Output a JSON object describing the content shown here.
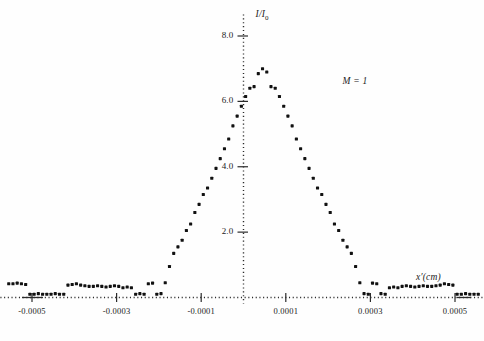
{
  "chart_data": {
    "type": "scatter",
    "title": "",
    "xlabel": "x'(cm)",
    "ylabel": "I/I_0",
    "ylabel_parts": {
      "numerator": "I",
      "denominator": "I",
      "subscript": "0"
    },
    "annotations": [
      {
        "text": "M = 1",
        "x": 0.00022,
        "y": 6.55
      }
    ],
    "xlim": [
      -0.00057,
      0.00057
    ],
    "ylim": [
      0,
      8.6
    ],
    "xticks": [
      -0.0005,
      -0.0003,
      -0.0001,
      0.0001,
      0.0003,
      0.0005
    ],
    "xtick_labels": [
      "-0.0005",
      "-0.0003",
      "-0.0001",
      "0.0001",
      "0.0003",
      "0.0005"
    ],
    "yticks": [
      2.0,
      4.0,
      6.0,
      8.0
    ],
    "ytick_labels": [
      "2.0",
      "4.0",
      "6.0",
      "8.0"
    ],
    "grid": false,
    "axis_style": "dotted",
    "marker": "square-dot",
    "marker_color": "#111111",
    "series": [
      {
        "name": "M = 1 intensity profile",
        "x": [
          -0.000555,
          -0.000545,
          -0.000535,
          -0.000525,
          -0.000515,
          -0.000505,
          -0.000495,
          -0.000485,
          -0.000475,
          -0.000465,
          -0.000455,
          -0.000445,
          -0.000435,
          -0.000425,
          -0.000415,
          -0.000405,
          -0.000395,
          -0.000385,
          -0.000375,
          -0.000365,
          -0.000355,
          -0.000345,
          -0.000335,
          -0.000325,
          -0.000315,
          -0.000305,
          -0.000295,
          -0.000285,
          -0.000275,
          -0.000265,
          -0.000255,
          -0.000245,
          -0.000235,
          -0.000225,
          -0.000215,
          -0.000205,
          -0.000195,
          -0.000185,
          -0.000175,
          -0.000165,
          -0.000155,
          -0.000145,
          -0.000135,
          -0.000125,
          -0.000115,
          -0.000105,
          -9.5e-05,
          -8.5e-05,
          -7.5e-05,
          -6.5e-05,
          -5.5e-05,
          -4.5e-05,
          -3.5e-05,
          -2.5e-05,
          -1.5e-05,
          -5e-06,
          5e-06,
          1.5e-05,
          2.5e-05,
          3.5e-05,
          4.5e-05,
          5.5e-05,
          6.5e-05,
          7.5e-05,
          8.5e-05,
          9.5e-05,
          0.000105,
          0.000115,
          0.000125,
          0.000135,
          0.000145,
          0.000155,
          0.000165,
          0.000175,
          0.000185,
          0.000195,
          0.000205,
          0.000215,
          0.000225,
          0.000235,
          0.000245,
          0.000255,
          0.000265,
          0.000275,
          0.000285,
          0.000295,
          0.000305,
          0.000315,
          0.000325,
          0.000335,
          0.000345,
          0.000355,
          0.000365,
          0.000375,
          0.000385,
          0.000395,
          0.000405,
          0.000415,
          0.000425,
          0.000435,
          0.000445,
          0.000455,
          0.000465,
          0.000475,
          0.000485,
          0.000495,
          0.000505,
          0.000515,
          0.000525,
          0.000535,
          0.000545,
          0.000555
        ],
        "y": [
          0.42,
          0.42,
          0.44,
          0.42,
          0.4,
          0.1,
          0.1,
          0.12,
          0.1,
          0.1,
          0.1,
          0.12,
          0.1,
          0.1,
          0.38,
          0.4,
          0.42,
          0.38,
          0.36,
          0.34,
          0.34,
          0.36,
          0.34,
          0.32,
          0.34,
          0.36,
          0.34,
          0.3,
          0.32,
          0.3,
          0.1,
          0.12,
          0.1,
          0.42,
          0.44,
          0.1,
          0.12,
          0.45,
          0.95,
          1.35,
          1.55,
          1.75,
          2.05,
          2.25,
          2.6,
          2.85,
          3.15,
          3.35,
          3.65,
          3.95,
          4.25,
          4.55,
          4.85,
          5.25,
          5.55,
          5.85,
          6.15,
          6.4,
          6.45,
          6.85,
          7.0,
          6.9,
          6.45,
          6.4,
          6.15,
          5.85,
          5.55,
          5.25,
          4.85,
          4.55,
          4.25,
          3.95,
          3.65,
          3.35,
          3.15,
          2.85,
          2.6,
          2.25,
          2.05,
          1.75,
          1.55,
          1.35,
          0.95,
          0.45,
          0.12,
          0.1,
          0.44,
          0.42,
          0.12,
          0.1,
          0.3,
          0.32,
          0.3,
          0.34,
          0.36,
          0.34,
          0.32,
          0.34,
          0.36,
          0.34,
          0.34,
          0.36,
          0.38,
          0.42,
          0.4,
          0.38,
          0.1,
          0.1,
          0.12,
          0.1,
          0.1,
          0.1
        ]
      }
    ]
  },
  "axes": {
    "x_axis_label": "x'(cm)",
    "y_axis_label_numerator": "I",
    "y_axis_label_denominator": "I",
    "y_axis_label_subscript": "0",
    "annotation_label": "M = 1"
  },
  "ticks": {
    "x": [
      {
        "label": "-0.0005",
        "value": -0.0005
      },
      {
        "label": "-0.0003",
        "value": -0.0003
      },
      {
        "label": "-0.0001",
        "value": -0.0001
      },
      {
        "label": "0.0001",
        "value": 0.0001
      },
      {
        "label": "0.0003",
        "value": 0.0003
      },
      {
        "label": "0.0005",
        "value": 0.0005
      }
    ],
    "y": [
      {
        "label": "2.0",
        "value": 2.0
      },
      {
        "label": "4.0",
        "value": 4.0
      },
      {
        "label": "6.0",
        "value": 6.0
      },
      {
        "label": "8.0",
        "value": 8.0
      }
    ]
  },
  "colors": {
    "marker": "#111111",
    "axis": "#2b2b2b",
    "background": "#fefefe",
    "text": "#222222"
  }
}
